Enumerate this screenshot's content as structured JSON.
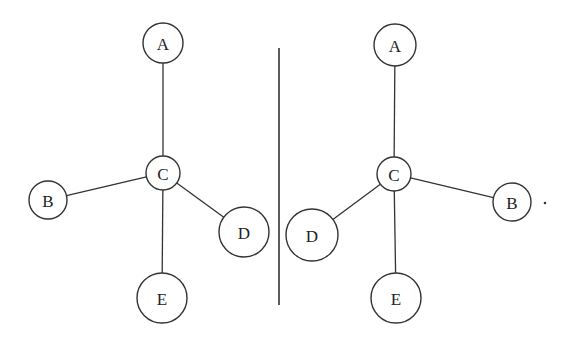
{
  "diagram": {
    "type": "mirror-image tree diagrams (chirality)",
    "colors": {
      "stroke": "#333333",
      "background": "#ffffff",
      "text": "#222222"
    },
    "left": {
      "nodes": [
        {
          "id": "A",
          "label": "A",
          "cx": 163,
          "cy": 43,
          "r": 20
        },
        {
          "id": "C",
          "label": "C",
          "cx": 163,
          "cy": 173,
          "r": 17
        },
        {
          "id": "B",
          "label": "B",
          "cx": 48,
          "cy": 200,
          "r": 19
        },
        {
          "id": "D",
          "label": "D",
          "cx": 244,
          "cy": 232,
          "r": 25
        },
        {
          "id": "E",
          "label": "E",
          "cx": 162,
          "cy": 298,
          "r": 25
        }
      ],
      "edges": [
        [
          "C",
          "A"
        ],
        [
          "C",
          "B"
        ],
        [
          "C",
          "D"
        ],
        [
          "C",
          "E"
        ]
      ]
    },
    "right": {
      "nodes": [
        {
          "id": "A",
          "label": "A",
          "cx": 395,
          "cy": 45,
          "r": 21
        },
        {
          "id": "C",
          "label": "C",
          "cx": 394,
          "cy": 174,
          "r": 17
        },
        {
          "id": "B",
          "label": "B",
          "cx": 512,
          "cy": 202,
          "r": 19
        },
        {
          "id": "D",
          "label": "D",
          "cx": 312,
          "cy": 235,
          "r": 26
        },
        {
          "id": "E",
          "label": "E",
          "cx": 396,
          "cy": 298,
          "r": 25
        }
      ],
      "edges": [
        [
          "C",
          "A"
        ],
        [
          "C",
          "B"
        ],
        [
          "C",
          "D"
        ],
        [
          "C",
          "E"
        ]
      ]
    },
    "divider": {
      "x": 279,
      "y1": 48,
      "y2": 305
    },
    "trailing_mark": {
      "text": ".",
      "x": 545,
      "y": 203
    }
  }
}
